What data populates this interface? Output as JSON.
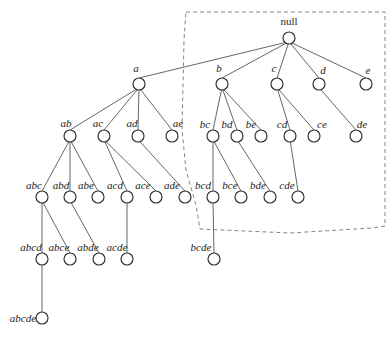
{
  "diagram": {
    "type": "set-enumeration-tree",
    "root": "null",
    "node_radius": 6,
    "boundary": {
      "style": "dashed",
      "color": "#777777",
      "points": [
        [
          186,
          12
        ],
        [
          385,
          12
        ],
        [
          385,
          226
        ],
        [
          372,
          228
        ],
        [
          290,
          233
        ],
        [
          200,
          229
        ],
        [
          196,
          205
        ],
        [
          186,
          170
        ],
        [
          182,
          130
        ],
        [
          184,
          40
        ],
        [
          186,
          12
        ]
      ],
      "encloses": [
        "null",
        "b",
        "c",
        "d",
        "e",
        "bc",
        "bd",
        "be",
        "cd",
        "ce",
        "de",
        "bcd",
        "bce",
        "bde",
        "cde"
      ]
    },
    "nodes": [
      {
        "id": "null",
        "label": "null",
        "x": 289,
        "y": 38,
        "lx": 289,
        "ly": 25,
        "anchor": "middle",
        "italic": false
      },
      {
        "id": "a",
        "label": "a",
        "x": 139,
        "y": 84,
        "lx": 136,
        "ly": 72,
        "anchor": "middle",
        "italic": true
      },
      {
        "id": "b",
        "label": "b",
        "x": 222,
        "y": 84,
        "lx": 219,
        "ly": 72,
        "anchor": "middle",
        "italic": true
      },
      {
        "id": "c",
        "label": "c",
        "x": 277,
        "y": 84,
        "lx": 274,
        "ly": 72,
        "anchor": "middle",
        "italic": true
      },
      {
        "id": "d",
        "label": "d",
        "x": 319,
        "y": 84,
        "lx": 323,
        "ly": 74,
        "anchor": "middle",
        "italic": true
      },
      {
        "id": "e",
        "label": "e",
        "x": 366,
        "y": 84,
        "lx": 368,
        "ly": 74,
        "anchor": "middle",
        "italic": true
      },
      {
        "id": "ab",
        "label": "ab",
        "x": 70,
        "y": 136,
        "lx": 66,
        "ly": 127,
        "anchor": "middle",
        "italic": true
      },
      {
        "id": "ac",
        "label": "ac",
        "x": 104,
        "y": 136,
        "lx": 98,
        "ly": 127,
        "anchor": "middle",
        "italic": true
      },
      {
        "id": "ad",
        "label": "ad",
        "x": 138,
        "y": 136,
        "lx": 132,
        "ly": 127,
        "anchor": "middle",
        "italic": true
      },
      {
        "id": "ae",
        "label": "ae",
        "x": 172,
        "y": 136,
        "lx": 178,
        "ly": 127,
        "anchor": "middle",
        "italic": true
      },
      {
        "id": "bc",
        "label": "bc",
        "x": 213,
        "y": 136,
        "lx": 205,
        "ly": 128,
        "anchor": "middle",
        "italic": true
      },
      {
        "id": "bd",
        "label": "bd",
        "x": 237,
        "y": 136,
        "lx": 227,
        "ly": 128,
        "anchor": "middle",
        "italic": true
      },
      {
        "id": "be",
        "label": "be",
        "x": 261,
        "y": 136,
        "lx": 251,
        "ly": 128,
        "anchor": "middle",
        "italic": true
      },
      {
        "id": "cd",
        "label": "cd",
        "x": 290,
        "y": 136,
        "lx": 282,
        "ly": 128,
        "anchor": "middle",
        "italic": true
      },
      {
        "id": "ce",
        "label": "ce",
        "x": 314,
        "y": 136,
        "lx": 322,
        "ly": 128,
        "anchor": "middle",
        "italic": true
      },
      {
        "id": "de",
        "label": "de",
        "x": 356,
        "y": 136,
        "lx": 362,
        "ly": 128,
        "anchor": "middle",
        "italic": true
      },
      {
        "id": "abc",
        "label": "abc",
        "x": 42,
        "y": 197,
        "lx": 34,
        "ly": 189,
        "anchor": "middle",
        "italic": true
      },
      {
        "id": "abd",
        "label": "abd",
        "x": 70,
        "y": 197,
        "lx": 61,
        "ly": 189,
        "anchor": "middle",
        "italic": true
      },
      {
        "id": "abe",
        "label": "abe",
        "x": 98,
        "y": 197,
        "lx": 86,
        "ly": 189,
        "anchor": "middle",
        "italic": true
      },
      {
        "id": "acd",
        "label": "acd",
        "x": 127,
        "y": 197,
        "lx": 115,
        "ly": 189,
        "anchor": "middle",
        "italic": true
      },
      {
        "id": "ace",
        "label": "ace",
        "x": 156,
        "y": 197,
        "lx": 143,
        "ly": 189,
        "anchor": "middle",
        "italic": true
      },
      {
        "id": "ade",
        "label": "ade",
        "x": 185,
        "y": 197,
        "lx": 172,
        "ly": 189,
        "anchor": "middle",
        "italic": true
      },
      {
        "id": "bcd",
        "label": "bcd",
        "x": 213,
        "y": 197,
        "lx": 203,
        "ly": 189,
        "anchor": "middle",
        "italic": true
      },
      {
        "id": "bce",
        "label": "bce",
        "x": 241,
        "y": 197,
        "lx": 230,
        "ly": 189,
        "anchor": "middle",
        "italic": true
      },
      {
        "id": "bde",
        "label": "bde",
        "x": 270,
        "y": 197,
        "lx": 258,
        "ly": 189,
        "anchor": "middle",
        "italic": true
      },
      {
        "id": "cde",
        "label": "cde",
        "x": 298,
        "y": 197,
        "lx": 287,
        "ly": 189,
        "anchor": "middle",
        "italic": true
      },
      {
        "id": "abcd",
        "label": "abcd",
        "x": 42,
        "y": 259,
        "lx": 31,
        "ly": 251,
        "anchor": "middle",
        "italic": true
      },
      {
        "id": "abce",
        "label": "abce",
        "x": 70,
        "y": 259,
        "lx": 59,
        "ly": 251,
        "anchor": "middle",
        "italic": true
      },
      {
        "id": "abde",
        "label": "abde",
        "x": 99,
        "y": 259,
        "lx": 88,
        "ly": 251,
        "anchor": "middle",
        "italic": true
      },
      {
        "id": "acde",
        "label": "acde",
        "x": 127,
        "y": 259,
        "lx": 117,
        "ly": 251,
        "anchor": "middle",
        "italic": true
      },
      {
        "id": "bcde",
        "label": "bcde",
        "x": 214,
        "y": 259,
        "lx": 201,
        "ly": 251,
        "anchor": "middle",
        "italic": true
      },
      {
        "id": "abcde",
        "label": "abcde",
        "x": 42,
        "y": 318,
        "lx": 23,
        "ly": 322,
        "anchor": "middle",
        "italic": true
      }
    ],
    "edges": [
      [
        "null",
        "a"
      ],
      [
        "null",
        "b"
      ],
      [
        "null",
        "c"
      ],
      [
        "null",
        "d"
      ],
      [
        "null",
        "e"
      ],
      [
        "a",
        "ab"
      ],
      [
        "a",
        "ac"
      ],
      [
        "a",
        "ad"
      ],
      [
        "a",
        "ae"
      ],
      [
        "b",
        "bc"
      ],
      [
        "b",
        "bd"
      ],
      [
        "b",
        "be"
      ],
      [
        "c",
        "cd"
      ],
      [
        "c",
        "ce"
      ],
      [
        "d",
        "de"
      ],
      [
        "ab",
        "abc"
      ],
      [
        "ab",
        "abd"
      ],
      [
        "ab",
        "abe"
      ],
      [
        "ac",
        "acd"
      ],
      [
        "ac",
        "ace"
      ],
      [
        "ad",
        "ade"
      ],
      [
        "bc",
        "bcd"
      ],
      [
        "bc",
        "bce"
      ],
      [
        "bd",
        "bde"
      ],
      [
        "cd",
        "cde"
      ],
      [
        "abc",
        "abcd"
      ],
      [
        "abc",
        "abce"
      ],
      [
        "abd",
        "abde"
      ],
      [
        "acd",
        "acde"
      ],
      [
        "bcd",
        "bcde"
      ],
      [
        "abcd",
        "abcde"
      ]
    ]
  }
}
